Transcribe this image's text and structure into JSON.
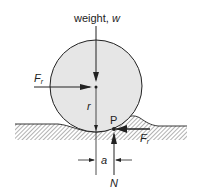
{
  "diagram": {
    "title_label": "weight, ",
    "weight_symbol": "w",
    "friction_force": "F",
    "friction_subscript": "r",
    "radius_label": "r",
    "contact_point_label": "P",
    "offset_label": "a",
    "normal_force_label": "N",
    "colors": {
      "wheel_fill": "#e6e6e6",
      "stroke": "#222222",
      "hatch": "#555555"
    }
  }
}
